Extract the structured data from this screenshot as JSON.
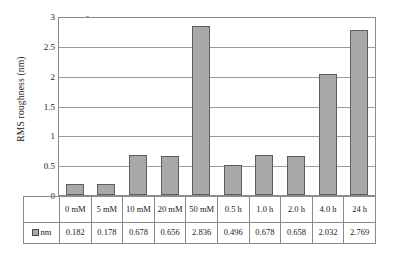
{
  "chart_data": {
    "type": "bar",
    "title": "",
    "xlabel": "",
    "ylabel": "RMS roughness  (nm)",
    "ylim": [
      0,
      3
    ],
    "yticks": [
      0,
      0.5,
      1,
      1.5,
      2,
      2.5,
      3
    ],
    "ytick_labels": [
      "0",
      "0.5",
      "1",
      "1.5",
      "2",
      "2.5",
      "3"
    ],
    "grid": true,
    "legend": [
      "nm"
    ],
    "legend_position": "table-row-header",
    "categories": [
      "0 mM",
      "5 mM",
      "10 mM",
      "20 mM",
      "50 mM",
      "0.5 h",
      "1.0 h",
      "2.0 h",
      "4.0 h",
      "24 h"
    ],
    "series": [
      {
        "name": "nm",
        "values": [
          0.182,
          0.178,
          0.678,
          0.656,
          2.836,
          0.496,
          0.678,
          0.658,
          2.032,
          2.769
        ],
        "value_labels": [
          "0.182",
          "0.178",
          "0.678",
          "0.656",
          "2.836",
          "0.496",
          "0.678",
          "0.658",
          "2.032",
          "2.769"
        ],
        "color": "#a8a8a8",
        "edge_color": "#5e5e5e"
      }
    ]
  },
  "table": {
    "legend_label": "nm",
    "legend_swatch_color": "#a8a8a8"
  }
}
